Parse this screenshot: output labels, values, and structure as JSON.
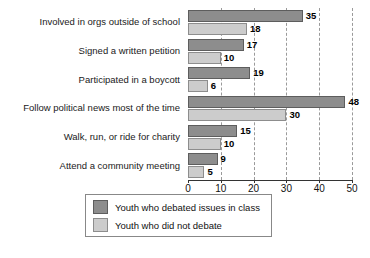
{
  "chart_data": {
    "type": "bar",
    "orientation": "horizontal",
    "title": "",
    "xlabel": "",
    "ylabel": "",
    "xlim": [
      0,
      50
    ],
    "xticks": [
      0,
      10,
      20,
      30,
      40,
      50
    ],
    "xtick_labels": [
      "0",
      "10",
      "20",
      "30",
      "40",
      "50"
    ],
    "grid": true,
    "grid_axis": "x",
    "grid_style": "dashed",
    "legend_position": "bottom",
    "categories": [
      "Involved in orgs outside of school",
      "Signed a written petition",
      "Participated in a boycott",
      "Follow political news most of the time",
      "Walk, run, or ride for charity",
      "Attend a community meeting"
    ],
    "series": [
      {
        "name": "Youth who debated issues in class",
        "color": "#8d8d8d",
        "values": [
          35,
          17,
          19,
          48,
          15,
          9
        ]
      },
      {
        "name": "Youth who did not debate",
        "color": "#cccccc",
        "values": [
          18,
          10,
          6,
          30,
          10,
          5
        ]
      }
    ],
    "value_labels": {
      "Youth who debated issues in class": [
        "35",
        "17",
        "19",
        "48",
        "15",
        "9"
      ],
      "Youth who did not debate": [
        "18",
        "10",
        "6",
        "30",
        "10",
        "5"
      ]
    }
  },
  "legend": {
    "items": [
      {
        "label": "Youth who debated issues in class",
        "swatch": "dark"
      },
      {
        "label": "Youth who did not debate",
        "swatch": "light"
      }
    ]
  },
  "caption": {
    "text": ""
  }
}
